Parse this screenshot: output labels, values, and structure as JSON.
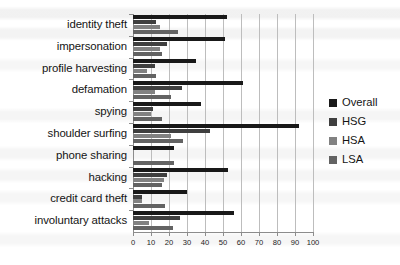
{
  "chart_data": {
    "type": "bar",
    "orientation": "horizontal",
    "title": "",
    "xlabel": "",
    "ylabel": "",
    "xlim": [
      0,
      100
    ],
    "xticks": [
      0,
      10,
      20,
      30,
      40,
      50,
      60,
      70,
      80,
      90,
      100
    ],
    "grid": true,
    "legend_position": "right",
    "categories": [
      "identity theft",
      "impersonation",
      "profile harvesting",
      "defamation",
      "spying",
      "shoulder surfing",
      "phone sharing",
      "hacking",
      "credit card theft",
      "involuntary attacks"
    ],
    "series": [
      {
        "name": "Overall",
        "color": "#191919",
        "values": [
          52,
          51,
          35,
          61,
          38,
          92,
          23,
          53,
          30,
          56
        ]
      },
      {
        "name": "HSG",
        "color": "#3f3f3f",
        "values": [
          13,
          19,
          12,
          27,
          11,
          43,
          0,
          19,
          5,
          26
        ]
      },
      {
        "name": "HSA",
        "color": "#818181",
        "values": [
          15,
          15,
          8,
          12,
          10,
          21,
          0,
          17,
          5,
          9
        ]
      },
      {
        "name": "LSA",
        "color": "#636363",
        "values": [
          25,
          16,
          13,
          21,
          16,
          28,
          23,
          16,
          18,
          22
        ]
      }
    ]
  },
  "legend": {
    "items": [
      {
        "label": "Overall",
        "color": "#191919"
      },
      {
        "label": "HSG",
        "color": "#3f3f3f"
      },
      {
        "label": "HSA",
        "color": "#818181"
      },
      {
        "label": "LSA",
        "color": "#636363"
      }
    ]
  }
}
